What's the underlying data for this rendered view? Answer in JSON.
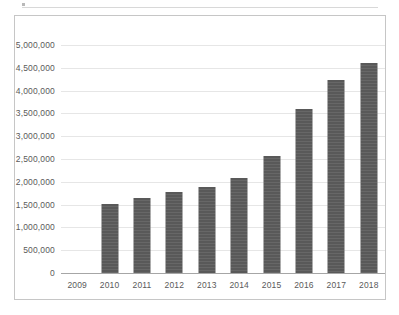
{
  "chart_data": {
    "type": "bar",
    "title": "",
    "xlabel": "",
    "ylabel": "",
    "categories": [
      "2009",
      "2010",
      "2011",
      "2012",
      "2013",
      "2014",
      "2015",
      "2016",
      "2017",
      "2018"
    ],
    "values": [
      null,
      1510000,
      1640000,
      1780000,
      1890000,
      2080000,
      2570000,
      3600000,
      4230000,
      4600000
    ],
    "ylim": [
      0,
      5000000
    ],
    "ytick_values": [
      0,
      500000,
      1000000,
      1500000,
      2000000,
      2500000,
      3000000,
      3500000,
      4000000,
      4500000,
      5000000
    ],
    "ytick_labels": [
      "0",
      "500,000",
      "1,000,000",
      "1,500,000",
      "2,000,000",
      "2,500,000",
      "3,000,000",
      "3,500,000",
      "4,000,000",
      "4,500,000",
      "5,000,000"
    ],
    "grid": true,
    "legend": false,
    "bar_color": "#595959",
    "gridline_color": "#e6e6e6",
    "axis_color": "#a6a6a6",
    "border_color": "#c6c6c6",
    "label_color": "#5a5a5a"
  }
}
